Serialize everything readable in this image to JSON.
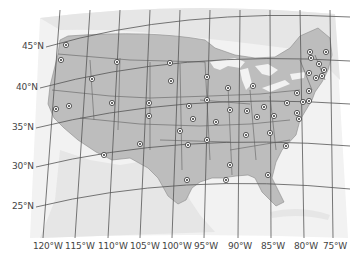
{
  "map": {
    "type": "reference-map",
    "subject": "Contiguous United States with state capitals",
    "colors": {
      "background": "#ffffff",
      "ocean": "#f2f2f2",
      "neighbor_land": "#e6e6e6",
      "us_land": "#bdbdbd",
      "lakes": "#f2f2f2",
      "graticule": "#555555",
      "state_border": "#6e6e6e",
      "capital_marker": "#333333"
    },
    "latitude_labels": [
      {
        "label": "45°N",
        "x": 22,
        "y": 47
      },
      {
        "label": "40°N",
        "x": 16,
        "y": 88
      },
      {
        "label": "35°N",
        "x": 12,
        "y": 128
      },
      {
        "label": "30°N",
        "x": 12,
        "y": 167
      },
      {
        "label": "25°N",
        "x": 12,
        "y": 207
      }
    ],
    "longitude_labels": [
      {
        "label": "120°W",
        "x": 33
      },
      {
        "label": "115°W",
        "x": 65
      },
      {
        "label": "110°W",
        "x": 98
      },
      {
        "label": "105°W",
        "x": 130
      },
      {
        "label": "100°W",
        "x": 162
      },
      {
        "label": "95°W",
        "x": 194
      },
      {
        "label": "90°W",
        "x": 228
      },
      {
        "label": "85°W",
        "x": 261
      },
      {
        "label": "80°W",
        "x": 294
      },
      {
        "label": "75°W",
        "x": 323
      }
    ],
    "capitals": [
      {
        "x": 66,
        "y": 45
      },
      {
        "x": 61,
        "y": 60
      },
      {
        "x": 117,
        "y": 62
      },
      {
        "x": 92,
        "y": 79
      },
      {
        "x": 56,
        "y": 109
      },
      {
        "x": 69,
        "y": 106
      },
      {
        "x": 112,
        "y": 103
      },
      {
        "x": 149,
        "y": 103
      },
      {
        "x": 149,
        "y": 116
      },
      {
        "x": 170,
        "y": 63
      },
      {
        "x": 171,
        "y": 81
      },
      {
        "x": 207,
        "y": 77
      },
      {
        "x": 207,
        "y": 100
      },
      {
        "x": 189,
        "y": 106
      },
      {
        "x": 193,
        "y": 119
      },
      {
        "x": 216,
        "y": 122
      },
      {
        "x": 180,
        "y": 131
      },
      {
        "x": 207,
        "y": 140
      },
      {
        "x": 188,
        "y": 145
      },
      {
        "x": 228,
        "y": 88
      },
      {
        "x": 230,
        "y": 110
      },
      {
        "x": 253,
        "y": 86
      },
      {
        "x": 247,
        "y": 111
      },
      {
        "x": 257,
        "y": 117
      },
      {
        "x": 264,
        "y": 107
      },
      {
        "x": 274,
        "y": 116
      },
      {
        "x": 287,
        "y": 103
      },
      {
        "x": 297,
        "y": 113
      },
      {
        "x": 310,
        "y": 52
      },
      {
        "x": 326,
        "y": 52
      },
      {
        "x": 311,
        "y": 58
      },
      {
        "x": 319,
        "y": 64
      },
      {
        "x": 324,
        "y": 70
      },
      {
        "x": 309,
        "y": 73
      },
      {
        "x": 316,
        "y": 78
      },
      {
        "x": 322,
        "y": 76
      },
      {
        "x": 297,
        "y": 93
      },
      {
        "x": 309,
        "y": 91
      },
      {
        "x": 303,
        "y": 102
      },
      {
        "x": 309,
        "y": 101
      },
      {
        "x": 299,
        "y": 119
      },
      {
        "x": 246,
        "y": 135
      },
      {
        "x": 270,
        "y": 133
      },
      {
        "x": 286,
        "y": 146
      },
      {
        "x": 230,
        "y": 165
      },
      {
        "x": 226,
        "y": 180
      },
      {
        "x": 268,
        "y": 175
      },
      {
        "x": 187,
        "y": 180
      },
      {
        "x": 104,
        "y": 155
      },
      {
        "x": 140,
        "y": 144
      }
    ]
  }
}
